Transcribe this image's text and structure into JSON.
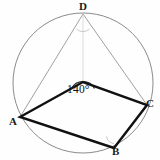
{
  "figure": {
    "background_color": "#fefefe",
    "stroke_color_thick": "#111111",
    "stroke_color_thin": "#8a8a8a",
    "circle": {
      "name": "circumscribed-circle",
      "cx": 83,
      "cy": 83,
      "r": 70,
      "stroke": "#7d7d7d",
      "stroke_width": 0.9
    },
    "points": [
      {
        "id": "A",
        "label": "A",
        "x": 20,
        "y": 117
      },
      {
        "id": "B",
        "label": "B",
        "x": 114,
        "y": 148
      },
      {
        "id": "C",
        "label": "C",
        "x": 147,
        "y": 105
      },
      {
        "id": "D",
        "label": "D",
        "x": 83,
        "y": 14
      },
      {
        "id": "P",
        "label": "",
        "x": 83,
        "y": 82
      }
    ],
    "quadrilateral": {
      "name": "quadrilateral-A-P-C-B",
      "vertices": "20,117 83,82 147,105 114,148",
      "stroke": "#111111",
      "stroke_width": 2.4,
      "fill": "none"
    },
    "thin_segments": [
      {
        "name": "segment-D-A",
        "x1": 83,
        "y1": 14,
        "x2": 20,
        "y2": 117
      },
      {
        "name": "segment-D-C",
        "x1": 83,
        "y1": 14,
        "x2": 147,
        "y2": 105
      },
      {
        "name": "segment-D-P",
        "x1": 83,
        "y1": 14,
        "x2": 83,
        "y2": 82
      }
    ],
    "angle_marks": [
      {
        "name": "angle-arc-apex",
        "at": "P",
        "value": "140°",
        "path": "M 71.5 88.5 A 13 13 0 0 1 94.5 88.5",
        "stroke": "#1a1a1a",
        "stroke_width": 1.1
      },
      {
        "name": "angle-arc-D",
        "at": "D",
        "value": "",
        "path": "M 76.5 29 A 9.5 9.5 0 0 0 89.5 29",
        "stroke": "#b9b9b9",
        "stroke_width": 0.8
      },
      {
        "name": "angle-arc-B",
        "at": "B",
        "value": "",
        "path": "M 106.5 136.5 A 8 8 0 0 0 114 143.5",
        "stroke": "#b9b9b9",
        "stroke_width": 0.8
      }
    ],
    "labels": {
      "A": "A",
      "B": "B",
      "C": "C",
      "D": "D",
      "apex_angle": "140°"
    }
  }
}
